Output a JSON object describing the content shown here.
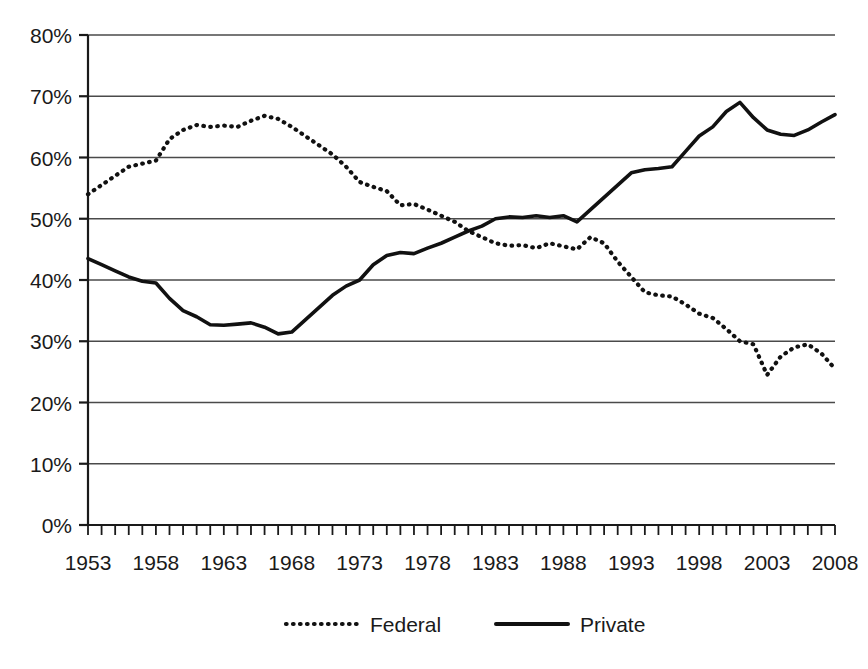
{
  "chart_data": {
    "type": "line",
    "title": "",
    "subtitle": "",
    "xlabel": "",
    "ylabel": "",
    "xlim": [
      1953,
      2008
    ],
    "ylim": [
      0,
      80
    ],
    "yunit": "%",
    "grid": true,
    "grid_axis": "y",
    "legend_position": "bottom",
    "ytick_labels": [
      "80%",
      "70%",
      "60%",
      "50%",
      "40%",
      "30%",
      "20%",
      "10%",
      "0%"
    ],
    "ytick_values": [
      80,
      70,
      60,
      50,
      40,
      30,
      20,
      10,
      0
    ],
    "xtick_labels": [
      "1953",
      "1958",
      "1963",
      "1968",
      "1973",
      "1978",
      "1983",
      "1988",
      "1993",
      "1998",
      "2003",
      "2008"
    ],
    "xtick_values": [
      1953,
      1958,
      1963,
      1968,
      1973,
      1978,
      1983,
      1988,
      1993,
      1998,
      2003,
      2008
    ],
    "xtick_minor_interval": 1,
    "x": [
      1953,
      1954,
      1955,
      1956,
      1957,
      1958,
      1959,
      1960,
      1961,
      1962,
      1963,
      1964,
      1965,
      1966,
      1967,
      1968,
      1969,
      1970,
      1971,
      1972,
      1973,
      1974,
      1975,
      1976,
      1977,
      1978,
      1979,
      1980,
      1981,
      1982,
      1983,
      1984,
      1985,
      1986,
      1987,
      1988,
      1989,
      1990,
      1991,
      1992,
      1993,
      1994,
      1995,
      1996,
      1997,
      1998,
      1999,
      2000,
      2001,
      2002,
      2003,
      2004,
      2005,
      2006,
      2007,
      2008
    ],
    "series": [
      {
        "name": "Federal",
        "style": "dotted",
        "color": "#111111",
        "values": [
          54.0,
          55.5,
          57.0,
          58.5,
          59.0,
          59.5,
          63.0,
          64.5,
          65.3,
          65.0,
          65.2,
          65.0,
          66.0,
          66.8,
          66.3,
          65.0,
          63.5,
          62.0,
          60.5,
          58.5,
          56.0,
          55.2,
          54.5,
          52.2,
          52.4,
          51.5,
          50.5,
          49.5,
          48.0,
          47.0,
          46.0,
          45.6,
          45.7,
          45.2,
          46.0,
          45.5,
          45.0,
          47.0,
          46.0,
          43.0,
          40.5,
          38.0,
          37.5,
          37.3,
          36.0,
          34.5,
          33.8,
          32.0,
          30.0,
          29.5,
          24.5,
          27.5,
          29.0,
          29.5,
          28.0,
          25.5
        ]
      },
      {
        "name": "Private",
        "style": "solid",
        "color": "#111111",
        "values": [
          43.5,
          42.5,
          41.5,
          40.5,
          39.8,
          39.5,
          37.0,
          35.0,
          34.0,
          32.7,
          32.6,
          32.8,
          33.0,
          32.3,
          31.2,
          31.5,
          33.5,
          35.5,
          37.5,
          39.0,
          40.0,
          42.5,
          44.0,
          44.5,
          44.3,
          45.2,
          46.0,
          47.0,
          48.0,
          48.8,
          50.0,
          50.3,
          50.2,
          50.5,
          50.2,
          50.5,
          49.5,
          51.5,
          53.5,
          55.5,
          57.5,
          58.0,
          58.2,
          58.5,
          61.0,
          63.5,
          65.0,
          67.5,
          69.0,
          66.5,
          64.5,
          63.8,
          63.6,
          64.5,
          65.8,
          67.0
        ]
      }
    ]
  },
  "legend": {
    "items": [
      {
        "label": "Federal",
        "style": "dotted"
      },
      {
        "label": "Private",
        "style": "solid"
      }
    ]
  }
}
